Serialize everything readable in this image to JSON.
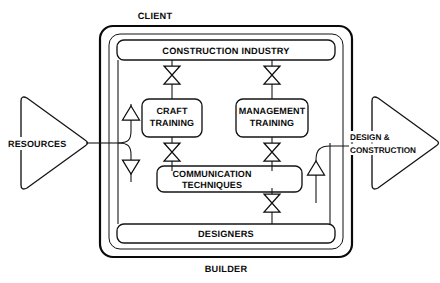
{
  "diagram": {
    "title_top": "CLIENT",
    "title_bottom": "BUILDER",
    "bands": {
      "top": "CONSTRUCTION INDUSTRY",
      "bottom": "DESIGNERS"
    },
    "boxes": [
      {
        "id": "craft",
        "line1": "CRAFT",
        "line2": "TRAINING"
      },
      {
        "id": "management",
        "line1": "MANAGEMENT",
        "line2": "TRAINING"
      },
      {
        "id": "communication",
        "line1": "COMMUNICATION",
        "line2": "TECHNIQUES"
      }
    ],
    "io": {
      "input": {
        "label": "RESOURCES"
      },
      "output": {
        "line1": "DESIGN &",
        "line2": "CONSTRUCTION"
      }
    },
    "connectors": {
      "valve_name": "bowtie-valve-icon",
      "up_arrow_name": "up-triangle-icon",
      "down_arrow_name": "down-triangle-icon"
    },
    "colors": {
      "ink": "#111111",
      "paper": "#ffffff"
    }
  }
}
